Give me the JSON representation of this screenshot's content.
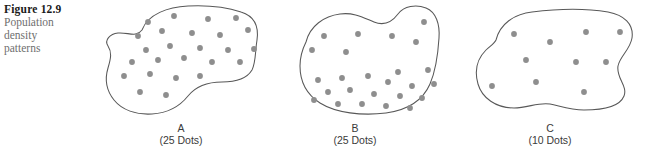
{
  "caption": {
    "figure_number": "Figure 12.9",
    "description_lines": [
      "Population",
      "density",
      "patterns"
    ]
  },
  "colors": {
    "dot": "#8e8e8e",
    "outline": "#585858",
    "figure_number_text": "#1a1a1a",
    "caption_text": "#6f6f6f",
    "label_text": "#3a3a3a",
    "background": "#ffffff"
  },
  "panels": [
    {
      "id": "a",
      "letter": "A",
      "count_label": "(25 Dots)",
      "dot_count": 25,
      "pattern": "uniform",
      "outline_path": "M 46 30 C 52 14, 72 7, 92 6 C 112 5, 130 7, 145 12 C 158 16, 163 26, 161 40 C 159 52, 160 62, 156 70 C 150 80, 138 82, 126 82 C 112 82, 100 86, 92 96 C 84 106, 72 113, 56 114 C 40 115, 26 110, 18 100 C 10 90, 9 78, 12 68 C 15 58, 16 52, 12 46 C 8 40, 14 34, 22 33 C 32 32, 40 38, 46 30 Z",
      "dots": [
        [
          52,
          22
        ],
        [
          78,
          16
        ],
        [
          112,
          19
        ],
        [
          140,
          18
        ],
        [
          42,
          36
        ],
        [
          66,
          31
        ],
        [
          96,
          33
        ],
        [
          124,
          35
        ],
        [
          152,
          30
        ],
        [
          50,
          50
        ],
        [
          74,
          46
        ],
        [
          104,
          48
        ],
        [
          132,
          50
        ],
        [
          158,
          49
        ],
        [
          36,
          62
        ],
        [
          62,
          60
        ],
        [
          88,
          58
        ],
        [
          116,
          62
        ],
        [
          144,
          62
        ],
        [
          28,
          76
        ],
        [
          54,
          74
        ],
        [
          80,
          78
        ],
        [
          104,
          76
        ],
        [
          44,
          92
        ],
        [
          70,
          95
        ]
      ]
    },
    {
      "id": "b",
      "letter": "B",
      "count_label": "(25 Dots)",
      "dot_count": 25,
      "pattern": "clustered",
      "outline_path": "M 30 42 C 34 26, 48 16, 64 14 C 78 12, 88 18, 98 22 C 108 26, 116 22, 122 14 C 128 6, 140 4, 150 8 C 160 12, 164 24, 163 38 C 162 54, 160 70, 154 84 C 147 100, 132 110, 110 113 C 86 116, 60 113, 44 103 C 30 94, 24 80, 24 66 C 24 56, 26 50, 30 42 Z",
      "dots": [
        [
          48,
          36
        ],
        [
          82,
          34
        ],
        [
          116,
          36
        ],
        [
          148,
          22
        ],
        [
          36,
          50
        ],
        [
          70,
          52
        ],
        [
          140,
          42
        ],
        [
          122,
          72
        ],
        [
          152,
          70
        ],
        [
          42,
          80
        ],
        [
          66,
          78
        ],
        [
          92,
          76
        ],
        [
          112,
          82
        ],
        [
          136,
          86
        ],
        [
          158,
          84
        ],
        [
          52,
          92
        ],
        [
          74,
          90
        ],
        [
          98,
          94
        ],
        [
          124,
          96
        ],
        [
          146,
          98
        ],
        [
          38,
          100
        ],
        [
          62,
          104
        ],
        [
          86,
          104
        ],
        [
          110,
          106
        ],
        [
          134,
          108
        ]
      ]
    },
    {
      "id": "c",
      "letter": "C",
      "count_label": "(10 Dots)",
      "dot_count": 10,
      "pattern": "sparse",
      "outline_path": "M 44 40 C 48 24, 62 14, 80 12 C 104 9, 132 8, 156 12 C 172 15, 182 24, 180 38 C 178 50, 168 56, 166 66 C 164 78, 176 86, 172 96 C 168 106, 152 110, 132 110 C 118 110, 108 106, 98 104 C 86 102, 76 108, 62 108 C 44 108, 30 98, 26 84 C 22 70, 26 58, 34 50 C 38 46, 42 44, 44 40 Z",
      "dots": [
        [
          62,
          34
        ],
        [
          98,
          42
        ],
        [
          134,
          32
        ],
        [
          168,
          32
        ],
        [
          74,
          60
        ],
        [
          124,
          62
        ],
        [
          154,
          62
        ],
        [
          40,
          86
        ],
        [
          84,
          82
        ],
        [
          132,
          92
        ]
      ]
    }
  ]
}
